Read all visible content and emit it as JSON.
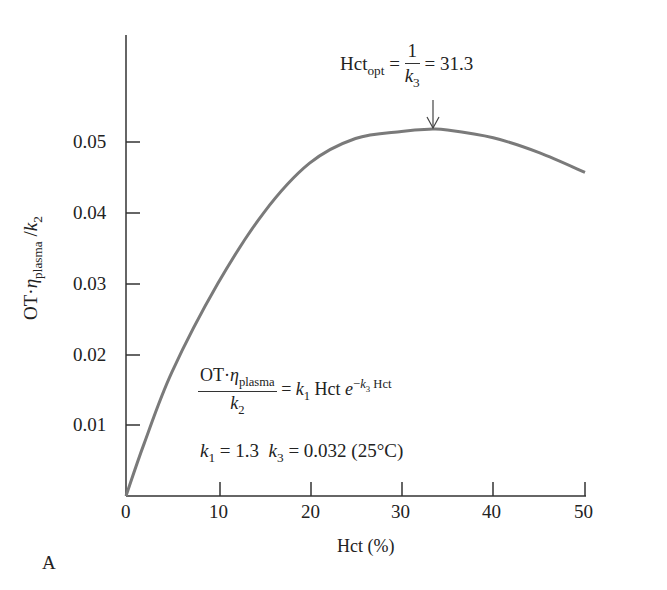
{
  "chart_data": {
    "type": "line",
    "panel_label": "A",
    "title": "",
    "xlabel": "Hct (%)",
    "ylabel": "OT·η_plasma / k_2",
    "xlim": [
      0,
      50
    ],
    "ylim": [
      0,
      0.06
    ],
    "x_ticks": [
      "0",
      "10",
      "20",
      "30",
      "40",
      "50"
    ],
    "y_ticks": [
      "0.01",
      "0.02",
      "0.03",
      "0.04",
      "0.05"
    ],
    "grid": false,
    "series": [
      {
        "name": "OT·η_plasma/k_2 vs Hct",
        "x": [
          0,
          2,
          5,
          10,
          15,
          20,
          25,
          30,
          33,
          35,
          40,
          45,
          50
        ],
        "y": [
          0,
          0.0075,
          0.0175,
          0.03,
          0.04,
          0.047,
          0.0505,
          0.0515,
          0.0518,
          0.0517,
          0.0506,
          0.0485,
          0.0457
        ]
      }
    ],
    "annotations": [
      {
        "text": "Hct_opt = 1/k_3 = 31.3",
        "x": 31.3,
        "arrow": true
      },
      {
        "text": "OT·η_plasma / k_2 = k_1 Hct e^(−k_3 Hct)"
      },
      {
        "text": "k_1 = 1.3  k_3 = 0.032 (25°C)"
      }
    ]
  },
  "labels": {
    "panel": "A",
    "xlabel_main": "Hct",
    "xlabel_unit": "(%)",
    "y_ot": "OT",
    "y_dot": "·",
    "y_eta": "η",
    "y_eta_sub": "plasma",
    "y_slash": " /",
    "y_k": "k",
    "y_k_sub": "2",
    "opt_hct": "Hct",
    "opt_sub": "opt",
    "opt_eq": "=",
    "opt_num": "1",
    "opt_den_k": "k",
    "opt_den_sub": "3",
    "opt_val": "= 31.3",
    "eq_num_ot": "OT",
    "eq_num_dot": "·",
    "eq_num_eta": "η",
    "eq_num_eta_sub": "plasma",
    "eq_den_k": "k",
    "eq_den_sub": "2",
    "eq_eq": "=",
    "eq_k1": "k",
    "eq_k1_sub": "1",
    "eq_hct": "Hct",
    "eq_e": "e",
    "eq_exp_minus": "−",
    "eq_exp_k": "k",
    "eq_exp_sub": "3",
    "eq_exp_hct": "Hct",
    "param_k1": "k",
    "param_k1_sub": "1",
    "param_k1_val": "= 1.3",
    "param_k3": "k",
    "param_k3_sub": "3",
    "param_k3_val": "= 0.032 (25°C)"
  },
  "colors": {
    "curve": "#7a7a7a",
    "axis": "#333333",
    "text": "#222222"
  }
}
